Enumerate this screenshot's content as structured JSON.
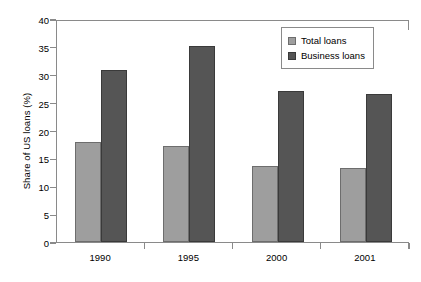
{
  "chart_data": {
    "type": "bar",
    "title": "",
    "subtitle": "",
    "xlabel": "",
    "ylabel": "Share of US loans (%)",
    "categories": [
      "1990",
      "1995",
      "2000",
      "2001"
    ],
    "series": [
      {
        "name": "Total loans",
        "values": [
          18.0,
          17.2,
          13.6,
          13.3
        ],
        "color": "#9e9e9e"
      },
      {
        "name": "Business loans",
        "values": [
          30.9,
          35.2,
          27.1,
          26.5
        ],
        "color": "#555555"
      }
    ],
    "ylim": [
      0,
      40
    ],
    "ytick_labels": [
      "0",
      "5",
      "10",
      "15",
      "20",
      "25",
      "30",
      "35",
      "40"
    ],
    "ytick_values": [
      0,
      5,
      10,
      15,
      20,
      25,
      30,
      35,
      40
    ],
    "grid": false,
    "legend_position": "top-right",
    "legend_entries": [
      "Total loans",
      "Business loans"
    ]
  }
}
